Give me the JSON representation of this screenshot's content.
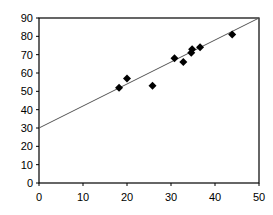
{
  "chart_data": {
    "type": "scatter",
    "title": "",
    "xlabel": "",
    "ylabel": "",
    "xlim": [
      0,
      50
    ],
    "ylim": [
      0,
      90
    ],
    "x_ticks": [
      0,
      10,
      20,
      30,
      40,
      50
    ],
    "y_ticks": [
      0,
      10,
      20,
      30,
      40,
      50,
      60,
      70,
      80,
      90
    ],
    "grid": false,
    "legend": null,
    "marker": "diamond",
    "marker_color": "#000000",
    "series": [
      {
        "name": "data",
        "points": [
          {
            "x": 18.2,
            "y": 52
          },
          {
            "x": 20.0,
            "y": 57
          },
          {
            "x": 25.8,
            "y": 53
          },
          {
            "x": 30.8,
            "y": 68
          },
          {
            "x": 32.8,
            "y": 66
          },
          {
            "x": 34.6,
            "y": 71
          },
          {
            "x": 34.8,
            "y": 73
          },
          {
            "x": 36.6,
            "y": 74
          },
          {
            "x": 43.9,
            "y": 81
          }
        ]
      }
    ],
    "trendline": {
      "x0": 0,
      "y0": 30,
      "x1": 50,
      "y1": 90,
      "color": "#555555"
    }
  }
}
